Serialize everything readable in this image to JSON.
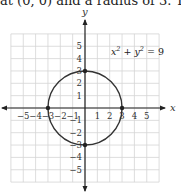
{
  "caption": "at (0, 0) and a radius of 3. The gra",
  "chart_data": {
    "type": "line",
    "title": "",
    "xlabel": "x",
    "ylabel": "y",
    "xlim": [
      -6,
      6
    ],
    "ylim": [
      -6,
      6
    ],
    "grid": true,
    "x_ticks": [
      -5,
      -4,
      -3,
      -2,
      -1,
      1,
      2,
      3,
      4,
      5
    ],
    "y_ticks": [
      5,
      4,
      3,
      2,
      1,
      -1,
      -2,
      -3,
      -4,
      -5
    ],
    "x_tick_labels": [
      "−5",
      "−4",
      "−3",
      "−2",
      "−1",
      "1",
      "2",
      "3",
      "4",
      "5"
    ],
    "y_tick_labels": [
      "5",
      "4",
      "3",
      "2",
      "1",
      "−1",
      "−2",
      "−3",
      "−4",
      "−5"
    ],
    "series": [
      {
        "name": "x² + y² = 9",
        "shape": "circle",
        "center": [
          0,
          0
        ],
        "radius": 3,
        "color": "#333333"
      }
    ],
    "points": [
      {
        "x": -3,
        "y": 0
      },
      {
        "x": 3,
        "y": 0
      },
      {
        "x": 0,
        "y": 3
      },
      {
        "x": 0,
        "y": -3
      }
    ],
    "annotations": [
      {
        "text_base": "x",
        "sup1": "2",
        "plus": " + ",
        "text_base2": "y",
        "sup2": "2",
        "rest": " = 9",
        "at": [
          2.5,
          4.5
        ]
      }
    ]
  }
}
